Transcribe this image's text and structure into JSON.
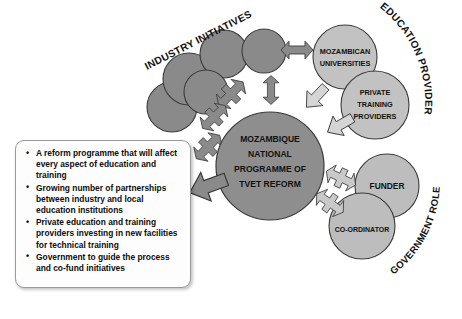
{
  "diagram": {
    "title_center": [
      "MOZAMBIQUE",
      "NATIONAL",
      "PROGRAMME OF",
      "TVET REFORM"
    ],
    "center_node_label": "MOZAMBIQUE NATIONAL PROGRAMME OF TVET REFORM",
    "category_labels": {
      "industry": "INDUSTRY INITIATIVES",
      "education": "EDUCATION PROVIDERS",
      "government": "GOVERNMENT ROLE"
    },
    "nodes": [
      {
        "id": "mozambican-universities",
        "lines": [
          "MOZAMBICAN",
          "UNIVERSITIES"
        ],
        "group": "education",
        "color": "#c2c2c2"
      },
      {
        "id": "private-training-providers",
        "lines": [
          "PRIVATE",
          "TRAINING",
          "PROVIDERS"
        ],
        "group": "education",
        "color": "#c2c2c2"
      },
      {
        "id": "funder",
        "lines": [
          "FUNDER"
        ],
        "group": "government",
        "color": "#bdbdbd"
      },
      {
        "id": "co-ordinator",
        "lines": [
          "CO-ORDINATOR"
        ],
        "group": "government",
        "color": "#bdbdbd"
      }
    ],
    "industry_circles": 5,
    "colors": {
      "center_circle": "#8e8e8e",
      "industry_circle": "#8a8a8a",
      "education_circle": "#c2c2c2",
      "government_circle": "#bdbdbd",
      "arrow_dark": "#8a8a8a",
      "arrow_light": "#d5d5d5",
      "outline": "#3a3a3a",
      "text": "#111111",
      "background": "#ffffff",
      "box_border": "#9a9a9a"
    }
  },
  "callout": {
    "bullets": [
      "A reform programme that will affect every aspect of education and training",
      "Growing number of partnerships between industry and local education institutions",
      "Private education and training providers investing in new facilities for technical training",
      "Government to guide the process and co-fund initiatives"
    ]
  }
}
